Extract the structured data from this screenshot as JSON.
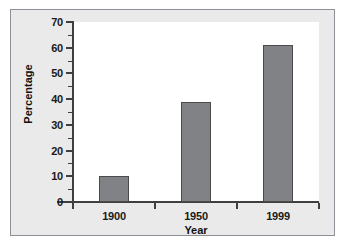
{
  "figure": {
    "background_color": "#eaeaea",
    "plot_background_color": "#ffffff",
    "frame_color": "#8d9096",
    "axis_color": "#3f3f3f"
  },
  "axis_titles": {
    "y": "Percentage",
    "x": "Year"
  },
  "chart_data": {
    "type": "bar",
    "title": "",
    "subtitle": "",
    "xlabel": "Year",
    "ylabel": "Percentage",
    "categories": [
      "1900",
      "1950",
      "1999"
    ],
    "values": [
      10,
      39,
      61
    ],
    "series": [
      {
        "name": "Percentage",
        "values": [
          10,
          39,
          61
        ],
        "color": "#808285",
        "edge_color": "#4a4a4c"
      }
    ],
    "ylim": [
      0,
      70
    ],
    "y_major_ticks": [
      0,
      10,
      20,
      30,
      40,
      50,
      60,
      70
    ],
    "y_minor_ticks": [
      5,
      15,
      25,
      35,
      45,
      55,
      65
    ],
    "y_tick_labels": [
      "0",
      "10",
      "20",
      "30",
      "40",
      "50",
      "60",
      "70"
    ],
    "x_tick_labels": [
      "1900",
      "1950",
      "1999"
    ],
    "grid": false,
    "legend": false,
    "legend_position": "none",
    "tick_direction": "out",
    "spines": [
      "left",
      "bottom"
    ],
    "bar_fill_color": "#808285",
    "bar_edge_color": "#4a4a4c",
    "annotations": []
  }
}
